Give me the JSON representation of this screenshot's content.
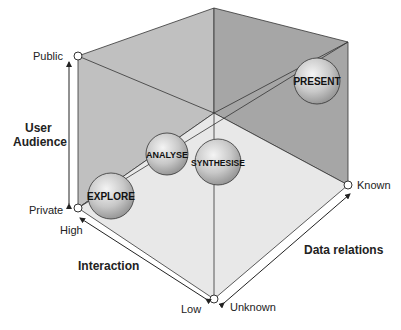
{
  "diagram": {
    "type": "3d-cube",
    "axes": {
      "user_audience": {
        "title_line1": "User",
        "title_line2": "Audience",
        "high_label": "Public",
        "low_label": "Private"
      },
      "interaction": {
        "title": "Interaction",
        "start_label": "High",
        "end_label": "Low"
      },
      "data_relations": {
        "title": "Data relations",
        "start_label": "Unknown",
        "end_label": "Known"
      }
    },
    "stages": [
      {
        "label": "EXPLORE"
      },
      {
        "label": "ANALYSE"
      },
      {
        "label": "SYNTHESISE"
      },
      {
        "label": "PRESENT"
      }
    ],
    "colors": {
      "left_wall": "#bdbdbd",
      "back_wall": "#a9a9a9",
      "floor": "#e6e6e6",
      "edge": "#333333"
    }
  }
}
